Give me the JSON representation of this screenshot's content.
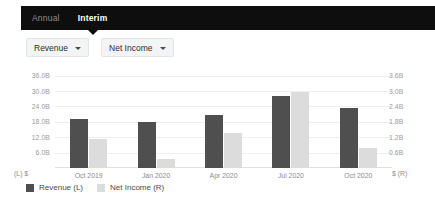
{
  "tabs": [
    {
      "label": "Annual",
      "active": false
    },
    {
      "label": "Interim",
      "active": true
    }
  ],
  "controls": {
    "left_dropdown": {
      "label": "Revenue",
      "icon": "chevron-down-icon"
    },
    "right_dropdown": {
      "label": "Net Income",
      "icon": "chevron-down-icon"
    }
  },
  "axis_corner": {
    "left": "(L)  $",
    "right": "$  (R)"
  },
  "legend": [
    {
      "label": "Revenue (L)",
      "color": "#4f4f4f"
    },
    {
      "label": "Net Income (R)",
      "color": "#dcdcdc"
    }
  ],
  "colors": {
    "revenue_bar": "#4f4f4f",
    "net_income_bar": "#dcdcdc",
    "tabbar_background": "#0e0e0e",
    "gridline": "#eeeeee",
    "dropdown_background": "#f3f4f6"
  },
  "chart_data": {
    "type": "bar",
    "title": "",
    "xlabel": "",
    "grid": true,
    "legend_position": "bottom-left",
    "categories": [
      "Oct 2019",
      "Jan 2020",
      "Apr 2020",
      "Jul 2020",
      "Oct 2020"
    ],
    "series": [
      {
        "name": "Revenue (L)",
        "axis": "left",
        "unit": "$",
        "values": [
          19.0,
          18.0,
          20.5,
          28.2,
          23.5
        ]
      },
      {
        "name": "Net Income (R)",
        "axis": "right",
        "unit": "$",
        "values": [
          1.15,
          0.35,
          1.35,
          2.95,
          0.8
        ]
      }
    ],
    "left_axis": {
      "label": "(L)  $",
      "ticks": [
        "36.0B",
        "30.0B",
        "24.0B",
        "18.0B",
        "12.0B",
        "6.0B"
      ],
      "tick_values": [
        36.0,
        30.0,
        24.0,
        18.0,
        12.0,
        6.0
      ],
      "ylim": [
        0,
        39
      ]
    },
    "right_axis": {
      "label": "$  (R)",
      "ticks": [
        "3.6B",
        "3.0B",
        "2.4B",
        "1.8B",
        "1.2B",
        "0.6B"
      ],
      "tick_values": [
        3.6,
        3.0,
        2.4,
        1.8,
        1.2,
        0.6
      ],
      "ylim": [
        0,
        3.9
      ]
    }
  }
}
